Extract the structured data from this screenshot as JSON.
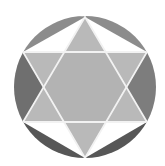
{
  "figure": {
    "background": "#ffffff",
    "stroke_color": "#f2f2f2",
    "circle": {
      "cx": 85,
      "cy": 87,
      "r": 71
    },
    "colors": {
      "segment_top_left": "#8c8c8c",
      "segment_top_right": "#8c8c8c",
      "segment_left": "#6f6f6f",
      "segment_right": "#7d7d7d",
      "segment_bottom_left": "#575757",
      "segment_bottom_right": "#575757",
      "star_point": "#b9b9b9",
      "hexagon_center": "#b3b3b3"
    }
  }
}
